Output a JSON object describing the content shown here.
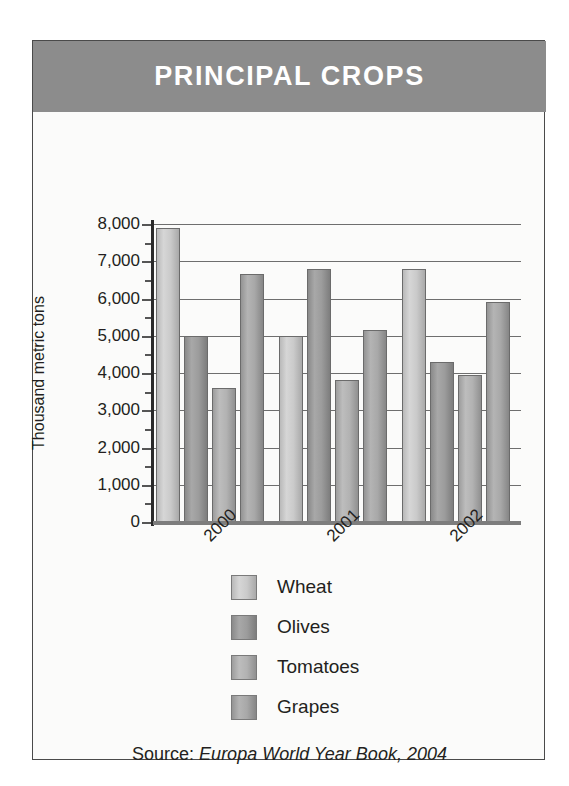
{
  "header": {
    "title": "PRINCIPAL CROPS",
    "background_color": "#8c8c8c",
    "text_color": "#ffffff"
  },
  "source": {
    "prefix": "Source:",
    "reference": "Europa World Year Book, 2004"
  },
  "legend": {
    "position": "below-axes",
    "items": [
      {
        "label": "Wheat",
        "color": "#cacaca"
      },
      {
        "label": "Olives",
        "color": "#9c9c9c"
      },
      {
        "label": "Tomatoes",
        "color": "#b2b2b2"
      },
      {
        "label": "Grapes",
        "color": "#a8a8a8"
      }
    ]
  },
  "axis": {
    "y_title": "Thousand metric tons",
    "y_ticks": [
      "8,000",
      "7,000",
      "6,000",
      "5,000",
      "4,000",
      "3,000",
      "2,000",
      "1,000",
      "0"
    ],
    "x_ticks": [
      "2000",
      "2001",
      "2002"
    ]
  },
  "chart_data": {
    "type": "bar",
    "title": "PRINCIPAL CROPS",
    "subtitle": "",
    "xlabel": "",
    "ylabel": "Thousand metric tons",
    "ylim": [
      0,
      8000
    ],
    "ytick_values": [
      0,
      1000,
      2000,
      3000,
      4000,
      5000,
      6000,
      7000,
      8000
    ],
    "grid": true,
    "grid_axis": "y",
    "legend_position": "bottom",
    "categories": [
      "2000",
      "2001",
      "2002"
    ],
    "series": [
      {
        "name": "Wheat",
        "color": "#cacaca",
        "values": [
          7900,
          5000,
          6800
        ]
      },
      {
        "name": "Olives",
        "color": "#9c9c9c",
        "values": [
          5000,
          6800,
          4300
        ]
      },
      {
        "name": "Tomatoes",
        "color": "#b2b2b2",
        "values": [
          3600,
          3800,
          3950
        ]
      },
      {
        "name": "Grapes",
        "color": "#a8a8a8",
        "values": [
          6650,
          5150,
          5900
        ]
      }
    ],
    "source": "Source: Europa World Year Book, 2004"
  }
}
